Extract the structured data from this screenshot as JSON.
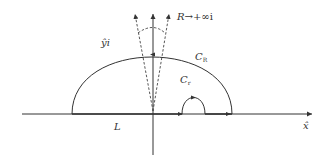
{
  "diagram": {
    "type": "contour-integration",
    "labels": {
      "imag_axis": "ŷi",
      "limit": "R",
      "limit_arrow": "→",
      "limit_target": "+∞i",
      "big_arc": "C",
      "big_arc_sub": "R",
      "small_arc": "C",
      "small_arc_sub": "r",
      "real_segment": "L",
      "real_axis": "x̂"
    },
    "colors": {
      "line": "#333333",
      "background": "#ffffff"
    }
  }
}
